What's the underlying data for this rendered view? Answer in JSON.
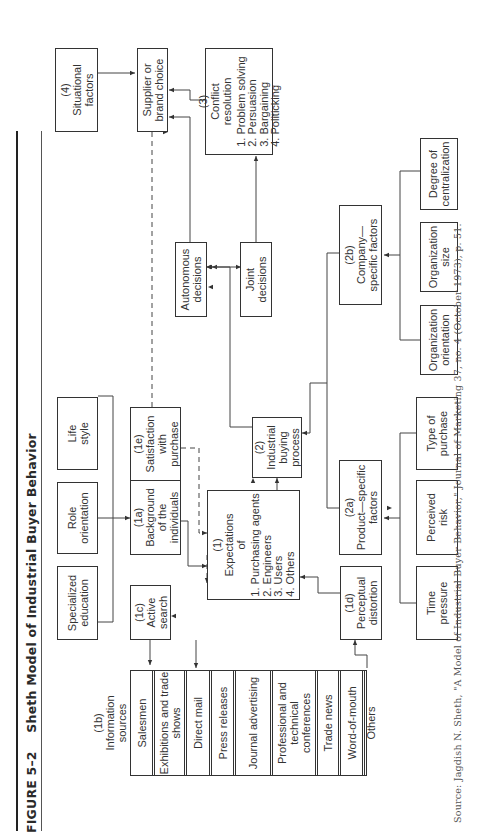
{
  "figure": {
    "number": "FIGURE 5–2",
    "title": "Sheth Model of Industrial Buyer Behavior"
  },
  "nodes": {
    "info_sources": {
      "code": "(1b)",
      "title": "Information sources",
      "items": [
        "Salesmen",
        "Exhibitions and trade shows",
        "Direct mail",
        "Press releases",
        "Journal advertising",
        "Professional and technical conferences",
        "Trade news",
        "Word-of-mouth",
        "Others"
      ]
    },
    "specialized_education": {
      "label": "Specialized education"
    },
    "role_orientation": {
      "label": "Role orientation"
    },
    "life_style": {
      "label": "Life style"
    },
    "active_search": {
      "code": "(1c)",
      "label": "Active search"
    },
    "background": {
      "code": "(1a)",
      "label": "Background of the individuals"
    },
    "satisfaction": {
      "code": "(1e)",
      "label": "Satisfaction with purchase"
    },
    "expectations": {
      "code": "(1)",
      "label": "Expectations of",
      "items": [
        "Purchasing agents",
        "Engineers",
        "Users",
        "Others"
      ]
    },
    "perceptual_distortion": {
      "code": "(1d)",
      "label": "Perceptual distortion"
    },
    "industrial_buying_process": {
      "code": "(2)",
      "label": "Industrial buying process"
    },
    "product_specific": {
      "code": "(2a)",
      "label": "Product—specific factors"
    },
    "time_pressure": {
      "label": "Time pressure"
    },
    "perceived_risk": {
      "label": "Perceived risk"
    },
    "type_of_purchase": {
      "label": "Type of purchase"
    },
    "company_specific": {
      "code": "(2b)",
      "label": "Company—specific factors"
    },
    "organization_orientation": {
      "label": "Organization orientation"
    },
    "organization_size": {
      "label": "Organization size"
    },
    "degree_of_centralization": {
      "label": "Degree of centralization"
    },
    "autonomous_decisions": {
      "label": "Autonomous decisions"
    },
    "joint_decisions": {
      "label": "Joint decisions"
    },
    "conflict_resolution": {
      "code": "(3)",
      "label": "Conflict resolution",
      "items": [
        "Problem solving",
        "Persuasion",
        "Bargaining",
        "Politicking"
      ]
    },
    "situational_factors": {
      "code": "(4)",
      "label": "Situational factors"
    },
    "supplier_choice": {
      "label": "Supplier or brand choice"
    }
  },
  "source": "Source: Jagdish N. Sheth, \"A Model of Industrial Buyer Behavior,\" Journal of Marketing 37, no. 4 (October 1973), p. 51."
}
